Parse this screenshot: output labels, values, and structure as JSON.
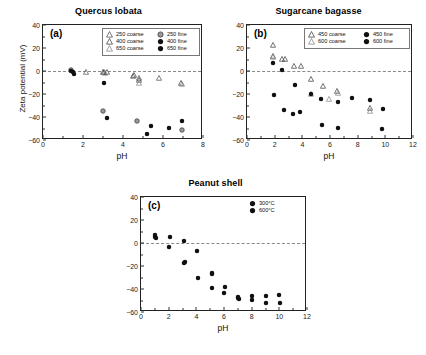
{
  "figure": {
    "background": "#ffffff",
    "axis_color": "#222222",
    "zero_line_color": "#8a8a8a"
  },
  "chart_data": [
    {
      "type": "scatter",
      "panel_tag": "(a)",
      "title": "Quercus lobata",
      "xlabel": "pH",
      "ylabel": "Zeta potential (mV)",
      "xlim": [
        0,
        8
      ],
      "ylim": [
        -60,
        40
      ],
      "xticks": [
        0,
        2,
        4,
        6,
        8
      ],
      "yticks": [
        -60,
        -40,
        -20,
        0,
        20,
        40
      ],
      "grid": false,
      "zero_line": 0,
      "legend_position": "top-right",
      "series": [
        {
          "name": "250 coarse",
          "marker": "triangle-open",
          "color": "#555555",
          "points": [
            {
              "x": 2.15,
              "y": 0.5
            },
            {
              "x": 3.05,
              "y": 0.8
            },
            {
              "x": 4.5,
              "y": -2.5
            },
            {
              "x": 4.8,
              "y": -4.5
            },
            {
              "x": 5.8,
              "y": -4.5
            }
          ]
        },
        {
          "name": "400 coarse",
          "marker": "triangle-open",
          "color": "#444444",
          "points": [
            {
              "x": 3.0,
              "y": 1.2
            },
            {
              "x": 3.2,
              "y": 0.5
            },
            {
              "x": 4.55,
              "y": -2.0
            },
            {
              "x": 4.82,
              "y": -6.0
            },
            {
              "x": 6.9,
              "y": -9.0
            }
          ]
        },
        {
          "name": "650 coarse",
          "marker": "triangle-open",
          "color": "#888888",
          "points": [
            {
              "x": 3.1,
              "y": 0.2
            },
            {
              "x": 4.8,
              "y": -8.5
            },
            {
              "x": 6.95,
              "y": -9.5
            }
          ]
        },
        {
          "name": "250 fine",
          "marker": "circle-gray",
          "color": "#8c8c8c",
          "points": [
            {
              "x": 1.38,
              "y": 2.5
            },
            {
              "x": 3.02,
              "y": -33.0
            },
            {
              "x": 4.72,
              "y": -41.8
            },
            {
              "x": 6.95,
              "y": -49.5
            }
          ]
        },
        {
          "name": "400 fine",
          "marker": "circle-filled",
          "color": "#111111",
          "points": [
            {
              "x": 1.42,
              "y": 2.0
            },
            {
              "x": 1.55,
              "y": -1.0
            },
            {
              "x": 3.05,
              "y": -9.0
            },
            {
              "x": 3.18,
              "y": -38.8
            },
            {
              "x": 5.38,
              "y": -46.2
            },
            {
              "x": 6.3,
              "y": -47.8
            },
            {
              "x": 6.95,
              "y": -42.0
            }
          ]
        },
        {
          "name": "650 fine",
          "marker": "circle-filled",
          "color": "#111111",
          "points": [
            {
              "x": 1.48,
              "y": 1.0
            },
            {
              "x": 5.2,
              "y": -53.2
            }
          ]
        }
      ]
    },
    {
      "type": "scatter",
      "panel_tag": "(b)",
      "title": "Sugarcane bagasse",
      "xlabel": "pH",
      "ylabel": "",
      "xlim": [
        0,
        12
      ],
      "ylim": [
        -60,
        40
      ],
      "xticks": [
        0,
        2,
        4,
        6,
        8,
        10,
        12
      ],
      "yticks": [
        -60,
        -40,
        -20,
        0,
        20,
        40
      ],
      "grid": false,
      "zero_line": 0,
      "legend_position": "top-right",
      "series": [
        {
          "name": "450 coarse",
          "marker": "triangle-open",
          "color": "#444444",
          "points": [
            {
              "x": 1.9,
              "y": 24.5
            },
            {
              "x": 1.85,
              "y": 15.0
            },
            {
              "x": 2.5,
              "y": 12.0
            },
            {
              "x": 2.75,
              "y": 12.0
            },
            {
              "x": 3.4,
              "y": 6.5
            },
            {
              "x": 3.9,
              "y": 6.5
            },
            {
              "x": 4.6,
              "y": -5.0
            },
            {
              "x": 5.5,
              "y": -11.5
            },
            {
              "x": 6.5,
              "y": -16.0
            },
            {
              "x": 8.9,
              "y": -30.0
            }
          ]
        },
        {
          "name": "600 coarse",
          "marker": "triangle-open",
          "color": "#888888",
          "points": [
            {
              "x": 1.88,
              "y": 13.5
            },
            {
              "x": 4.65,
              "y": -18.5
            },
            {
              "x": 5.9,
              "y": -22.5
            },
            {
              "x": 6.55,
              "y": -17.0
            },
            {
              "x": 8.9,
              "y": -33.0
            }
          ]
        },
        {
          "name": "450 fine",
          "marker": "circle-filled",
          "color": "#111111",
          "points": [
            {
              "x": 1.88,
              "y": 9.0
            },
            {
              "x": 2.55,
              "y": 3.0
            },
            {
              "x": 1.95,
              "y": -19.5
            },
            {
              "x": 3.5,
              "y": -10.0
            },
            {
              "x": 2.65,
              "y": -32.5
            },
            {
              "x": 4.6,
              "y": -18.5
            },
            {
              "x": 5.35,
              "y": -23.0
            },
            {
              "x": 6.6,
              "y": -25.0
            },
            {
              "x": 7.6,
              "y": -21.5
            },
            {
              "x": 8.9,
              "y": -23.5
            }
          ]
        },
        {
          "name": "600 fine",
          "marker": "circle-filled",
          "color": "#111111",
          "points": [
            {
              "x": 3.35,
              "y": -35.5
            },
            {
              "x": 3.85,
              "y": -34.0
            },
            {
              "x": 5.4,
              "y": -45.5
            },
            {
              "x": 6.6,
              "y": -48.0
            },
            {
              "x": 9.75,
              "y": -48.5
            },
            {
              "x": 9.8,
              "y": -31.5
            }
          ]
        }
      ]
    },
    {
      "type": "scatter",
      "panel_tag": "(c)",
      "title": "Peanut shell",
      "xlabel": "pH",
      "ylabel": "",
      "xlim": [
        0,
        12
      ],
      "ylim": [
        -60,
        40
      ],
      "xticks": [
        0,
        2,
        4,
        6,
        8,
        10,
        12
      ],
      "yticks": [
        -60,
        -40,
        -20,
        0,
        20,
        40
      ],
      "grid": false,
      "zero_line": 0,
      "legend_position": "top-right",
      "series": [
        {
          "name": "300°C",
          "marker": "circle-filled",
          "color": "#111111",
          "points": [
            {
              "x": 1.0,
              "y": 8.5
            },
            {
              "x": 1.05,
              "y": 6.0
            },
            {
              "x": 2.1,
              "y": 7.0
            },
            {
              "x": 2.05,
              "y": -1.5
            },
            {
              "x": 3.1,
              "y": 3.5
            },
            {
              "x": 3.15,
              "y": -15.0
            },
            {
              "x": 4.05,
              "y": -5.0
            },
            {
              "x": 4.1,
              "y": -28.5
            },
            {
              "x": 5.1,
              "y": -24.0
            },
            {
              "x": 5.15,
              "y": -37.0
            },
            {
              "x": 6.05,
              "y": -36.5
            },
            {
              "x": 6.0,
              "y": -42.0
            },
            {
              "x": 7.0,
              "y": -45.5
            },
            {
              "x": 7.05,
              "y": -47.0
            },
            {
              "x": 8.0,
              "y": -44.0
            },
            {
              "x": 8.05,
              "y": -47.5
            },
            {
              "x": 9.0,
              "y": -44.5
            },
            {
              "x": 9.05,
              "y": -50.0
            },
            {
              "x": 10.0,
              "y": -43.5
            },
            {
              "x": 10.05,
              "y": -50.0
            }
          ]
        },
        {
          "name": "600°C",
          "marker": "circle-filled",
          "color": "#111111",
          "points": [
            {
              "x": 1.02,
              "y": 7.2
            },
            {
              "x": 3.12,
              "y": -16.0
            },
            {
              "x": 5.12,
              "y": -25.0
            },
            {
              "x": 7.02,
              "y": -46.2
            }
          ]
        }
      ]
    }
  ],
  "panels": {
    "a": {
      "tag": "(a)",
      "title": "Quercus lobata",
      "xlabel": "pH",
      "ylabel": "Zeta potential (mV)",
      "ytick_labels": [
        "40",
        "20",
        "0",
        "-20",
        "-40",
        "-60"
      ],
      "xtick_labels": [
        "0",
        "2",
        "4",
        "6",
        "8"
      ],
      "legend": {
        "col1": [
          "250 coarse",
          "400 coarse",
          "650 coarse"
        ],
        "col2": [
          "250 fine",
          "400 fine",
          "650 fine"
        ]
      }
    },
    "b": {
      "tag": "(b)",
      "title": "Sugarcane bagasse",
      "xlabel": "pH",
      "ytick_labels": [
        "40",
        "20",
        "0",
        "-20",
        "-40",
        "-60"
      ],
      "xtick_labels": [
        "0",
        "2",
        "4",
        "6",
        "8",
        "10",
        "12"
      ],
      "legend": {
        "col1": [
          "450 coarse",
          "600 coarse"
        ],
        "col2": [
          "450 fine",
          "600 fine"
        ]
      }
    },
    "c": {
      "tag": "(c)",
      "title": "Peanut shell",
      "xlabel": "pH",
      "ytick_labels": [
        "40",
        "20",
        "0",
        "-20",
        "-40",
        "-60"
      ],
      "xtick_labels": [
        "0",
        "2",
        "4",
        "6",
        "8",
        "10",
        "12"
      ],
      "legend": {
        "col1": [
          "300°C",
          "600°C"
        ]
      }
    }
  }
}
